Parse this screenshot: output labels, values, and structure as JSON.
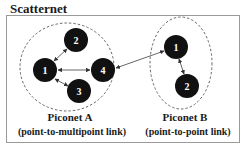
{
  "title": "Scatternet",
  "colors": {
    "node_fill": "#111111",
    "node_text": "#ffffff",
    "edge": "#555555",
    "dashed": "#666666",
    "frame": "#9a9a9a"
  },
  "piconets": [
    {
      "name": "Piconet A",
      "subtitle": "(point-to-multipoint link)",
      "nodes": [
        {
          "id": "A1",
          "label": "1"
        },
        {
          "id": "A2",
          "label": "2"
        },
        {
          "id": "A3",
          "label": "3"
        },
        {
          "id": "A4",
          "label": "4"
        }
      ],
      "links": [
        [
          "A1",
          "A2"
        ],
        [
          "A1",
          "A4"
        ],
        [
          "A1",
          "A3"
        ]
      ]
    },
    {
      "name": "Piconet B",
      "subtitle": "(point-to-point link)",
      "nodes": [
        {
          "id": "B1",
          "label": "1"
        },
        {
          "id": "B2",
          "label": "2"
        }
      ],
      "links": [
        [
          "B1",
          "B2"
        ]
      ]
    }
  ],
  "bridge_link": [
    "A4",
    "B1"
  ]
}
